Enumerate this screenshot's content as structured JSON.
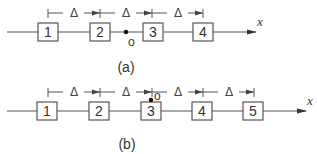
{
  "diagrams": [
    {
      "id": "a",
      "caption": "(a)",
      "axis_label": "x",
      "origin_label": "o",
      "spacing_label": "Δ",
      "boxes": [
        "1",
        "2",
        "3",
        "4"
      ],
      "spacing_labels": [
        "Δ",
        "Δ",
        "Δ"
      ]
    },
    {
      "id": "b",
      "caption": "(b)",
      "axis_label": "x",
      "origin_label": "o",
      "spacing_label": "Δ",
      "boxes": [
        "1",
        "2",
        "3",
        "4",
        "5"
      ],
      "spacing_labels": [
        "Δ",
        "Δ",
        "Δ",
        "Δ"
      ]
    }
  ]
}
